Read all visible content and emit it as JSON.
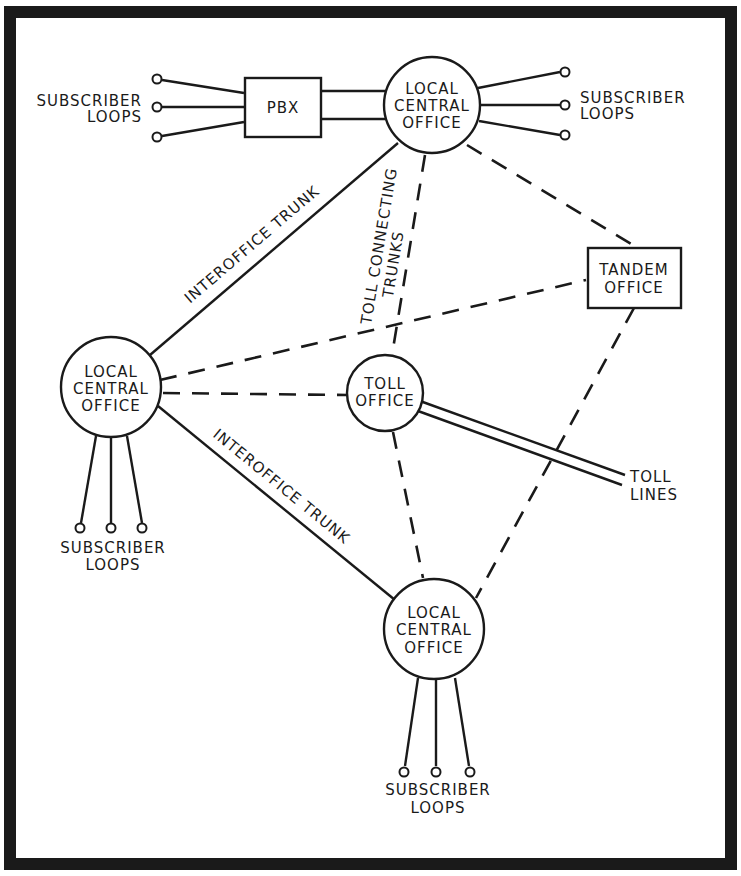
{
  "diagram": {
    "frame_color": "#1a1a1a",
    "nodes": {
      "pbx": {
        "label": "PBX"
      },
      "lco_top": {
        "line1": "LOCAL",
        "line2": "CENTRAL",
        "line3": "OFFICE"
      },
      "lco_left": {
        "line1": "LOCAL",
        "line2": "CENTRAL",
        "line3": "OFFICE"
      },
      "lco_bottom": {
        "line1": "LOCAL",
        "line2": "CENTRAL",
        "line3": "OFFICE"
      },
      "toll_office": {
        "line1": "TOLL",
        "line2": "OFFICE"
      },
      "tandem_office": {
        "line1": "TANDEM",
        "line2": "OFFICE"
      }
    },
    "labels": {
      "subscriber_loops_pbx": {
        "line1": "SUBSCRIBER",
        "line2": "LOOPS"
      },
      "subscriber_loops_top": {
        "line1": "SUBSCRIBER",
        "line2": "LOOPS"
      },
      "subscriber_loops_left": {
        "line1": "SUBSCRIBER",
        "line2": "LOOPS"
      },
      "subscriber_loops_bottom": {
        "line1": "SUBSCRIBER",
        "line2": "LOOPS"
      },
      "interoffice_trunk_upper": "INTEROFFICE TRUNK",
      "interoffice_trunk_lower": "INTEROFFICE TRUNK",
      "toll_connecting_trunks": {
        "line1": "TOLL CONNECTING",
        "line2": "TRUNKS"
      },
      "toll_lines": {
        "line1": "TOLL",
        "line2": "LINES"
      }
    },
    "connections": [
      {
        "from": "PBX",
        "to": "LOCAL CENTRAL OFFICE (top)",
        "type": "solid double"
      },
      {
        "from": "LOCAL CENTRAL OFFICE (top)",
        "to": "LOCAL CENTRAL OFFICE (left)",
        "type": "solid",
        "label": "INTEROFFICE TRUNK"
      },
      {
        "from": "LOCAL CENTRAL OFFICE (left)",
        "to": "LOCAL CENTRAL OFFICE (bottom)",
        "type": "solid",
        "label": "INTEROFFICE TRUNK"
      },
      {
        "from": "LOCAL CENTRAL OFFICE (top)",
        "to": "TOLL OFFICE",
        "type": "dashed",
        "label": "TOLL CONNECTING TRUNKS"
      },
      {
        "from": "LOCAL CENTRAL OFFICE (top)",
        "to": "TANDEM OFFICE",
        "type": "dashed"
      },
      {
        "from": "LOCAL CENTRAL OFFICE (left)",
        "to": "TANDEM OFFICE",
        "type": "dashed"
      },
      {
        "from": "LOCAL CENTRAL OFFICE (left)",
        "to": "TOLL OFFICE",
        "type": "dashed"
      },
      {
        "from": "TOLL OFFICE",
        "to": "LOCAL CENTRAL OFFICE (bottom)",
        "type": "dashed"
      },
      {
        "from": "TANDEM OFFICE",
        "to": "LOCAL CENTRAL OFFICE (bottom)",
        "type": "dashed"
      },
      {
        "from": "TOLL OFFICE",
        "to": "TOLL LINES",
        "type": "double line"
      }
    ]
  }
}
